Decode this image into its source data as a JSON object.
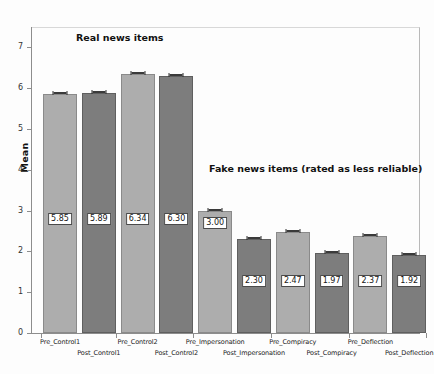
{
  "chart_data": {
    "type": "bar",
    "title": "",
    "xlabel": "",
    "ylabel": "Mean",
    "ylim": [
      0,
      7.5
    ],
    "yticks": [
      "0",
      "1",
      "2",
      "3",
      "4",
      "5",
      "6",
      "7"
    ],
    "grid": false,
    "legend": "none",
    "categories": [
      "Pre_Control1",
      "Post_Control1",
      "Pre_Control2",
      "Post_Control2",
      "Pre_Impersonation",
      "Post_Impersonation",
      "Pre_Compiracy",
      "Post_Compiracy",
      "Pre_Deflection",
      "Post_Deflection"
    ],
    "values": [
      5.85,
      5.89,
      6.34,
      6.3,
      3.0,
      2.3,
      2.47,
      1.97,
      2.37,
      1.92
    ],
    "value_labels": [
      "5.85",
      "5.89",
      "6.34",
      "6.30",
      "3.00",
      "2.30",
      "2.47",
      "1.97",
      "2.37",
      "1.92"
    ],
    "bar_shades": [
      "light",
      "dark",
      "light",
      "dark",
      "light",
      "dark",
      "light",
      "dark",
      "light",
      "dark"
    ],
    "annotations": [
      {
        "text": "Real news items"
      },
      {
        "text": "Fake news items (rated as less reliable)"
      }
    ],
    "colors": {
      "bar_light": "#adadad",
      "bar_dark": "#7d7d7d",
      "axis": "#8d8d8d",
      "label_box_border": "#4a4a4a",
      "text": "#111111"
    }
  }
}
